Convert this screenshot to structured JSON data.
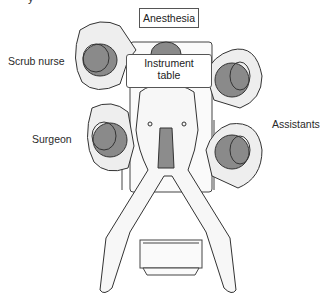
{
  "figure": {
    "cropped_heading_glyph": "y",
    "labels": {
      "anesthesia": "Anesthesia",
      "instrument_table_line1": "Instrument",
      "instrument_table_line2": "table",
      "scrub_nurse": "Scrub nurse",
      "surgeon": "Surgeon",
      "assistants": "Assistants"
    },
    "colors": {
      "background": "#ffffff",
      "line": "#333333",
      "head_fill": "#8a8a8a",
      "gown_fill": "#eeeeee",
      "body_fill": "#f7f7f7",
      "incision_fill": "#8c8c8c"
    }
  }
}
